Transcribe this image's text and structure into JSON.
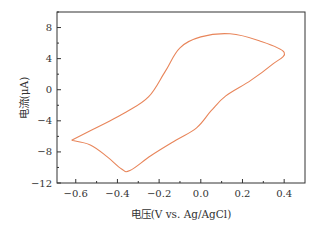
{
  "chart_data": {
    "type": "line",
    "title": "",
    "xlabel": "电压(V vs. Ag/AgCl)",
    "ylabel": "电流(μA)",
    "xlim": [
      -0.69,
      0.5
    ],
    "ylim": [
      -12,
      10
    ],
    "xticks": [
      -0.6,
      -0.4,
      -0.2,
      0.0,
      0.2,
      0.4
    ],
    "xtick_labels": [
      "−0.6",
      "−0.4",
      "−0.2",
      "0.0",
      "0.2",
      "0.4"
    ],
    "yticks": [
      -12,
      -8,
      -4,
      0,
      4,
      8
    ],
    "ytick_labels": [
      "−12",
      "−8",
      "−4",
      "0",
      "4",
      "8"
    ],
    "grid": false,
    "legend": null,
    "series": [
      {
        "name": "CV",
        "color": "#E8855A",
        "x": [
          -0.62,
          -0.48,
          -0.36,
          -0.25,
          -0.17,
          -0.1,
          0.0,
          0.14,
          0.28,
          0.4,
          0.34,
          0.24,
          0.12,
          0.05,
          -0.02,
          -0.12,
          -0.24,
          -0.34,
          -0.38,
          -0.45,
          -0.53,
          -0.62
        ],
        "y": [
          -6.5,
          -4.6,
          -2.9,
          -0.9,
          2.4,
          5.4,
          6.8,
          7.2,
          6.3,
          4.8,
          3.2,
          1.2,
          -0.8,
          -2.7,
          -4.9,
          -6.5,
          -8.5,
          -10.4,
          -10.2,
          -8.6,
          -7.1,
          -6.5
        ]
      }
    ]
  },
  "axes": {
    "frame_color": "#333333"
  }
}
